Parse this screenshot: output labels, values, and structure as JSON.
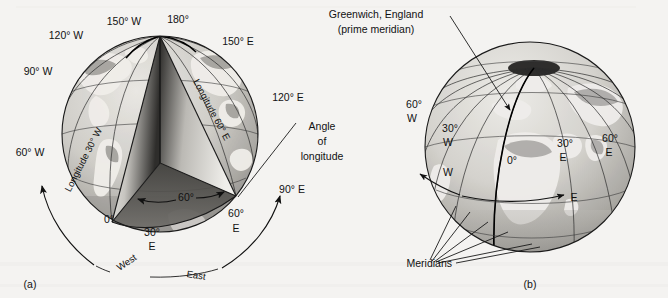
{
  "figure": {
    "background_color": "#f4f3f1",
    "ink_color": "#111111"
  },
  "panel_a": {
    "caption": "(a)",
    "description": "Cutaway globe showing the angle of longitude as a wedge removed from the Earth between the prime meridian and 60 degrees East.",
    "meridian_labels": [
      {
        "text": "180°",
        "x": 174,
        "y": 20,
        "anchor": "middle"
      },
      {
        "text": "150° W",
        "x": 124,
        "y": 22,
        "anchor": "middle"
      },
      {
        "text": "120° W",
        "x": 74,
        "y": 34,
        "anchor": "middle"
      },
      {
        "text": "90° W",
        "x": 40,
        "y": 71,
        "anchor": "middle"
      },
      {
        "text": "60° W",
        "x": 29,
        "y": 152,
        "anchor": "middle"
      },
      {
        "text": "150° E",
        "x": 232,
        "y": 41,
        "anchor": "middle"
      },
      {
        "text": "120° E",
        "x": 283,
        "y": 97,
        "anchor": "middle"
      },
      {
        "text": "90° E",
        "x": 290,
        "y": 189,
        "anchor": "middle"
      }
    ],
    "curved_labels": [
      {
        "text": "Longitude 30° W",
        "id": "longitude-30w-curve"
      },
      {
        "text": "Longitude 60° E",
        "id": "longitude-60e-curve"
      }
    ],
    "callout": {
      "line1": "Angle",
      "line2": "of",
      "line3": "longitude"
    },
    "wedge_angle_label": "60°",
    "equator_labels": [
      {
        "text": "0°",
        "x": 109,
        "y": 219
      },
      {
        "text": "30°",
        "x": 152,
        "y": 232
      },
      {
        "text": "E",
        "x": 152,
        "y": 246
      },
      {
        "text": "60°",
        "x": 235,
        "y": 214
      },
      {
        "text": "E",
        "x": 235,
        "y": 229
      }
    ],
    "direction_labels": [
      {
        "text": "West",
        "id": "west-arc-label"
      },
      {
        "text": "East",
        "id": "east-arc-label"
      }
    ]
  },
  "panel_b": {
    "caption": "(b)",
    "description": "Globe showing meridians converging at the North Pole, with the prime meridian through Greenwich, England highlighted.",
    "greenwich_callout": {
      "line1": "Greenwich, England",
      "line2": "(prime meridian)"
    },
    "meridian_labels": [
      {
        "text": "60°",
        "x": 412,
        "y": 104
      },
      {
        "text": "W",
        "x": 412,
        "y": 117
      },
      {
        "text": "30°",
        "x": 449,
        "y": 128
      },
      {
        "text": "W",
        "x": 449,
        "y": 141
      },
      {
        "text": "0°",
        "x": 512,
        "y": 160
      },
      {
        "text": "30°",
        "x": 563,
        "y": 143
      },
      {
        "text": "E",
        "x": 561,
        "y": 157
      },
      {
        "text": "60°",
        "x": 609,
        "y": 138
      },
      {
        "text": "E",
        "x": 609,
        "y": 152
      }
    ],
    "direction_labels": [
      {
        "text": "W",
        "x": 402,
        "y": 172
      },
      {
        "text": "E",
        "x": 572,
        "y": 197
      }
    ],
    "meridians_label": "Meridians"
  }
}
